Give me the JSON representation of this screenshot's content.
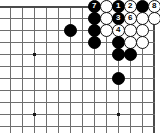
{
  "diagram": {
    "kind": "go-board-joseki-diagram",
    "board_origin_corner": "top-right",
    "grid": {
      "cell_px": 12,
      "x_lines": [
        10,
        22,
        34,
        46,
        58,
        70,
        82,
        94,
        106,
        118,
        130,
        142,
        154
      ],
      "y_lines": [
        6,
        18,
        30,
        42,
        54,
        66,
        78,
        90,
        102,
        114,
        126
      ],
      "top_edge_y": 6,
      "right_edge_x": 154
    },
    "star_points": [
      {
        "name": "star-point-left-upper",
        "x": 34,
        "y": 54
      },
      {
        "name": "star-point-left-lower",
        "x": 34,
        "y": 114
      },
      {
        "name": "star-point-right-lower",
        "x": 118,
        "y": 114
      }
    ],
    "stones": [
      {
        "id": "s-b-70-30",
        "color": "black",
        "x": 70,
        "y": 30,
        "label": ""
      },
      {
        "id": "s-b-94-18",
        "color": "black",
        "x": 94,
        "y": 18,
        "label": ""
      },
      {
        "id": "s-b-94-30",
        "color": "black",
        "x": 94,
        "y": 30,
        "label": ""
      },
      {
        "id": "s-b-94-42",
        "color": "black",
        "x": 94,
        "y": 42,
        "label": ""
      },
      {
        "id": "s-b-94-6",
        "color": "black",
        "x": 94,
        "y": 6,
        "label": "7"
      },
      {
        "id": "s-w-106-6",
        "color": "white",
        "x": 106,
        "y": 6,
        "label": ""
      },
      {
        "id": "s-b-118-6",
        "color": "black",
        "x": 118,
        "y": 6,
        "label": "1"
      },
      {
        "id": "s-w-130-6",
        "color": "white",
        "x": 130,
        "y": 6,
        "label": "2"
      },
      {
        "id": "s-b-142-6",
        "color": "black",
        "x": 142,
        "y": 6,
        "label": ""
      },
      {
        "id": "s-w-154-6",
        "color": "white",
        "x": 154,
        "y": 6,
        "label": "8"
      },
      {
        "id": "s-w-106-18",
        "color": "white",
        "x": 106,
        "y": 18,
        "label": ""
      },
      {
        "id": "s-b-118-18",
        "color": "black",
        "x": 118,
        "y": 18,
        "label": "3"
      },
      {
        "id": "s-w-130-18",
        "color": "white",
        "x": 130,
        "y": 18,
        "label": "6"
      },
      {
        "id": "s-w-142-18",
        "color": "white",
        "x": 142,
        "y": 18,
        "label": ""
      },
      {
        "id": "s-w-154-18",
        "color": "white",
        "x": 154,
        "y": 18,
        "label": ""
      },
      {
        "id": "s-w-106-30",
        "color": "white",
        "x": 106,
        "y": 30,
        "label": ""
      },
      {
        "id": "s-w-118-30",
        "color": "white",
        "x": 118,
        "y": 30,
        "label": "4"
      },
      {
        "id": "s-w-130-30",
        "color": "white",
        "x": 130,
        "y": 30,
        "label": ""
      },
      {
        "id": "s-w-142-30",
        "color": "white",
        "x": 142,
        "y": 30,
        "label": ""
      },
      {
        "id": "s-b-118-42",
        "color": "black",
        "x": 118,
        "y": 42,
        "label": ""
      },
      {
        "id": "s-w-130-42",
        "color": "white",
        "x": 130,
        "y": 42,
        "label": ""
      },
      {
        "id": "s-w-142-42",
        "color": "white",
        "x": 142,
        "y": 42,
        "label": ""
      },
      {
        "id": "s-b-118-54",
        "color": "black",
        "x": 118,
        "y": 54,
        "label": ""
      },
      {
        "id": "s-b-130-54",
        "color": "black",
        "x": 130,
        "y": 54,
        "label": ""
      },
      {
        "id": "s-b-118-78",
        "color": "black",
        "x": 118,
        "y": 78,
        "label": ""
      }
    ],
    "move_numbers": [
      "1",
      "2",
      "3",
      "4",
      "6",
      "7",
      "8"
    ],
    "colors": {
      "black_stone": "#000000",
      "white_stone": "#ffffff",
      "grid_line": "#6e6e6e",
      "edge_line": "#4a4a4a",
      "board_background": "#ffffff",
      "black_label_text": "#ffffff",
      "white_label_text": "#000000"
    }
  }
}
